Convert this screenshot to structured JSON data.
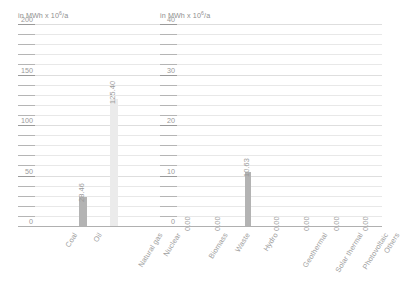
{
  "chart_data": [
    {
      "type": "bar",
      "title": "",
      "ylabel": "in MWh x 10⁶/a",
      "xlabel": "",
      "categories": [
        "Coal",
        "Oil",
        "Natural gas",
        "Nuclear"
      ],
      "values": [
        0,
        28.46,
        125.4,
        0
      ],
      "value_labels": [
        "",
        "28.46",
        "125.40",
        ""
      ],
      "bar_colors": [
        "#bdbdbd",
        "#b3b3b3",
        "#ebebeb",
        "#bdbdbd"
      ],
      "ylim": [
        0,
        200
      ],
      "yticks": [
        0,
        50,
        100,
        150,
        200
      ],
      "ytick_labels": [
        "0",
        "50",
        "100",
        "150",
        "200"
      ],
      "minor_tick_step": 10,
      "grid": true,
      "legend": "none"
    },
    {
      "type": "bar",
      "title": "",
      "ylabel": "in MWh x 10⁶/a",
      "xlabel": "",
      "categories": [
        "Biomass",
        "Waste",
        "Hydro",
        "Geothermal",
        "Solar thermal",
        "Photovoltaic",
        "Others"
      ],
      "values": [
        0.0,
        0.0,
        10.63,
        0.0,
        0.0,
        0.0,
        0.0
      ],
      "value_labels": [
        "0.00",
        "0.00",
        "10.63",
        "0.00",
        "0.00",
        "0.00",
        "0.00"
      ],
      "bar_colors": [
        "#bdbdbd",
        "#bdbdbd",
        "#b3b3b3",
        "#bdbdbd",
        "#bdbdbd",
        "#bdbdbd",
        "#bdbdbd"
      ],
      "ylim": [
        0,
        40
      ],
      "yticks": [
        0,
        10,
        20,
        30,
        40
      ],
      "ytick_labels": [
        "0",
        "10",
        "20",
        "30",
        "40"
      ],
      "minor_tick_step": 2,
      "grid": true,
      "legend": "none"
    }
  ]
}
